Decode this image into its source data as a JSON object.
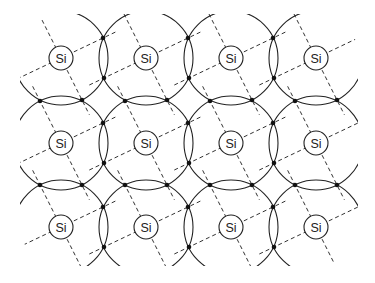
{
  "diagram": {
    "title": "Silicon crystal lattice (covalent bonding, 2D representation)",
    "atom_label": "Si",
    "colors": {
      "line": "#222222",
      "dash": "#333333",
      "dot": "#111111",
      "background": "#ffffff"
    },
    "grid": {
      "origin": [
        61,
        58
      ],
      "spacing": 85,
      "columns": 4,
      "rows": 3,
      "atom_radius": 12,
      "shell_radius": 47,
      "bond_dir_a": [
        21,
        42
      ],
      "bond_dir_b": [
        42,
        -20
      ]
    },
    "atoms": [
      {
        "label": "Si",
        "x": 61,
        "y": 58
      },
      {
        "label": "Si",
        "x": 146,
        "y": 58
      },
      {
        "label": "Si",
        "x": 231,
        "y": 58
      },
      {
        "label": "Si",
        "x": 316,
        "y": 58
      },
      {
        "label": "Si",
        "x": 61,
        "y": 143
      },
      {
        "label": "Si",
        "x": 146,
        "y": 143
      },
      {
        "label": "Si",
        "x": 231,
        "y": 143
      },
      {
        "label": "Si",
        "x": 316,
        "y": 143
      },
      {
        "label": "Si",
        "x": 61,
        "y": 227
      },
      {
        "label": "Si",
        "x": 146,
        "y": 227
      },
      {
        "label": "Si",
        "x": 231,
        "y": 227
      },
      {
        "label": "Si",
        "x": 316,
        "y": 227
      }
    ],
    "clip": {
      "x": 20,
      "y": 14,
      "width": 338,
      "height": 252
    }
  }
}
